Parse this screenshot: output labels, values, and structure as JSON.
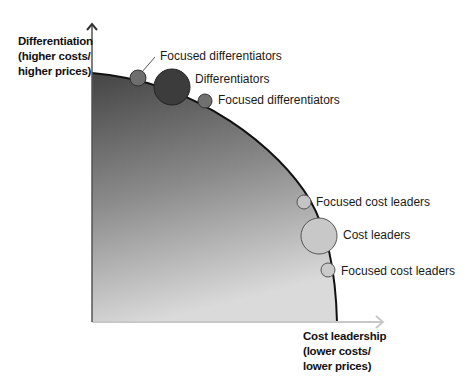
{
  "diagram": {
    "type": "strategy-frontier",
    "y_axis": {
      "line1": "Differentiation",
      "line2": "(higher costs/",
      "line3": "higher prices)"
    },
    "x_axis": {
      "line1": "Cost leadership",
      "line2": "(lower costs/",
      "line3": "lower prices)"
    },
    "points": [
      {
        "label": "Focused differentiators",
        "size": "small",
        "color": "#6e6e6e"
      },
      {
        "label": "Differentiators",
        "size": "large",
        "color": "#3c3c3c"
      },
      {
        "label": "Focused differentiators",
        "size": "small",
        "color": "#707070"
      },
      {
        "label": "Focused cost leaders",
        "size": "small",
        "color": "#c4c4c4"
      },
      {
        "label": "Cost leaders",
        "size": "large",
        "color": "#c8c8c8"
      },
      {
        "label": "Focused cost leaders",
        "size": "small",
        "color": "#cacaca"
      }
    ],
    "colors": {
      "gradient_top": "#4a4a4a",
      "gradient_bottom": "#d8d8d8",
      "frontier": "#111111",
      "y_axis": "#555555",
      "x_axis": "#c8c8c8"
    }
  }
}
